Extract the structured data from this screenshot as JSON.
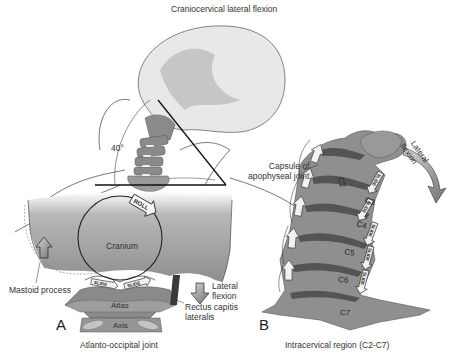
{
  "figure": {
    "title": "Craniocervical lateral flexion",
    "angle_label": "40°",
    "panel_a": {
      "letter": "A",
      "caption": "Atlanto-occipital joint",
      "labels": {
        "cranium": "Cranium",
        "roll": "ROLL",
        "mastoid": "Mastoid process",
        "lateral_flexion_line1": "Lateral",
        "lateral_flexion_line2": "flexion",
        "atlas": "Atlas",
        "axis": "Axis",
        "rectus_line1": "Rectus capitis",
        "rectus_line2": "lateralis",
        "slide_left": "SLIDE",
        "slide_right": "SLIDE"
      }
    },
    "panel_b": {
      "letter": "B",
      "caption": "Intracervical region (C2-C7)",
      "labels": {
        "capsule_line1": "Capsule of",
        "capsule_line2": "apophyseal joint",
        "lateral_flexion_line1": "Lateral",
        "lateral_flexion_line2": "flexion",
        "slide": "SLIDE"
      },
      "vertebrae": [
        "C2",
        "C3",
        "C4",
        "C5",
        "C6",
        "C7"
      ]
    },
    "colors": {
      "bone": "#8f8f8f",
      "bone_light": "#b4b4b4",
      "outline": "#333333",
      "head": "#e6e6e6",
      "arrow_fill": "#f2f2f2"
    }
  }
}
